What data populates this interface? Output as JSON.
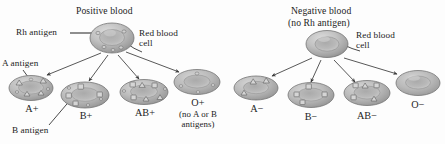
{
  "figure": {
    "kind": "blood-type-antigen-diagram",
    "left_group": {
      "title": "Positive blood",
      "parent_cell_label": "Red blood cell",
      "rh_callout": "Rh antigen",
      "a_callout": "A antigen",
      "b_callout": "B antigen",
      "cells": [
        {
          "id": "a-pos",
          "label": "A+",
          "sublabel": "",
          "antigens": "triangles",
          "rh": true
        },
        {
          "id": "b-pos",
          "label": "B+",
          "sublabel": "",
          "antigens": "squares",
          "rh": true
        },
        {
          "id": "ab-pos",
          "label": "AB+",
          "sublabel": "",
          "antigens": "both",
          "rh": true
        },
        {
          "id": "o-pos",
          "label": "O+",
          "sublabel": "(no A or B antigens)",
          "antigens": "none",
          "rh": true
        }
      ]
    },
    "right_group": {
      "title": "Negative blood",
      "title_sub": "(no Rh antigen)",
      "parent_cell_label": "Red blood cell",
      "cells": [
        {
          "id": "a-neg",
          "label": "A−",
          "antigens": "triangles",
          "rh": false
        },
        {
          "id": "b-neg",
          "label": "B−",
          "antigens": "squares",
          "rh": false
        },
        {
          "id": "ab-neg",
          "label": "AB−",
          "antigens": "both",
          "rh": false
        },
        {
          "id": "o-neg",
          "label": "O−",
          "antigens": "none",
          "rh": false
        }
      ]
    },
    "colors": {
      "cell_fill_light": "#c9c9c9",
      "cell_fill_mid": "#a8a8a8",
      "cell_fill_dark": "#8a8a8a",
      "outline": "#6b6b6b",
      "arrow": "#3a3a3a",
      "text": "#1c1c1c"
    }
  }
}
